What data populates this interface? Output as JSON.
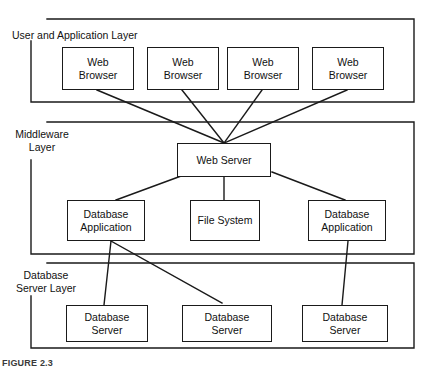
{
  "figure": {
    "caption": "FIGURE 2.3",
    "line_color": "#1a1a1a",
    "background": "#ffffff",
    "text_color": "#111111"
  },
  "layers": [
    {
      "id": "user-application-layer",
      "label": "User and Application Layer",
      "label_lines": [
        "User and Application Layer"
      ]
    },
    {
      "id": "middleware-layer",
      "label": "Middleware Layer",
      "label_lines": [
        "Middleware",
        "Layer"
      ]
    },
    {
      "id": "database-server-layer",
      "label": "Database Server Layer",
      "label_lines": [
        "Database",
        "Server Layer"
      ]
    }
  ],
  "nodes": {
    "browsers": [
      {
        "id": "web-browser-1",
        "label": "Web\nBrowser"
      },
      {
        "id": "web-browser-2",
        "label": "Web\nBrowser"
      },
      {
        "id": "web-browser-3",
        "label": "Web\nBrowser"
      },
      {
        "id": "web-browser-4",
        "label": "Web\nBrowser"
      }
    ],
    "web_server": {
      "id": "web-server",
      "label": "Web Server"
    },
    "middleware_services": [
      {
        "id": "database-application-left",
        "label": "Database\nApplication"
      },
      {
        "id": "file-system",
        "label": "File System"
      },
      {
        "id": "database-application-right",
        "label": "Database\nApplication"
      }
    ],
    "database_servers": [
      {
        "id": "database-server-1",
        "label": "Database\nServer"
      },
      {
        "id": "database-server-2",
        "label": "Database\nServer"
      },
      {
        "id": "database-server-3",
        "label": "Database\nServer"
      }
    ]
  },
  "connections": [
    {
      "from": "web-browser-1",
      "to": "web-server"
    },
    {
      "from": "web-browser-2",
      "to": "web-server"
    },
    {
      "from": "web-browser-3",
      "to": "web-server"
    },
    {
      "from": "web-browser-4",
      "to": "web-server"
    },
    {
      "from": "web-server",
      "to": "database-application-left"
    },
    {
      "from": "web-server",
      "to": "file-system"
    },
    {
      "from": "web-server",
      "to": "database-application-right"
    },
    {
      "from": "database-application-left",
      "to": "database-server-1"
    },
    {
      "from": "database-application-left",
      "to": "database-server-2"
    },
    {
      "from": "database-application-right",
      "to": "database-server-3"
    }
  ]
}
